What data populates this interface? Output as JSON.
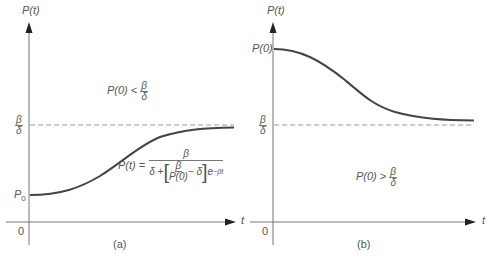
{
  "panels": [
    {
      "id": "a",
      "caption": "(a)",
      "y_axis_label": "P(t)",
      "x_axis_label": "t",
      "origin_label": "0",
      "start_label": "P",
      "start_label_sub": "0",
      "asymptote_num": "β",
      "asymptote_den": "δ",
      "condition_lhs": "P(0) <",
      "condition_num": "β",
      "condition_den": "δ",
      "formula_lhs": "P(t) =",
      "formula_num": "β",
      "formula_den_a": "δ +",
      "formula_inner_num": "β",
      "formula_inner_den": "P(0)",
      "formula_den_b": "− δ",
      "formula_exp_base": "e",
      "formula_exp": "−βt"
    },
    {
      "id": "b",
      "caption": "(b)",
      "y_axis_label": "P(t)",
      "x_axis_label": "t",
      "origin_label": "0",
      "start_label": "P(0)",
      "asymptote_num": "β",
      "asymptote_den": "δ",
      "condition_lhs": "P(0) >",
      "condition_num": "β",
      "condition_den": "δ"
    }
  ],
  "colors": {
    "axis": "#777777",
    "curve": "#444444",
    "dashed": "#999999",
    "text": "#555555"
  }
}
